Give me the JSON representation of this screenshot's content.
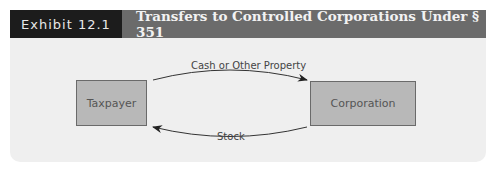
{
  "header": {
    "label": "Exhibit 12.1",
    "title": "Transfers to Controlled Corporations Under § 351"
  },
  "diagram": {
    "nodes": [
      {
        "id": "taxpayer",
        "label": "Taxpayer"
      },
      {
        "id": "corporation",
        "label": "Corporation"
      }
    ],
    "edges": [
      {
        "from": "taxpayer",
        "to": "corporation",
        "label": "Cash or Other Property"
      },
      {
        "from": "corporation",
        "to": "taxpayer",
        "label": "Stock"
      }
    ]
  },
  "colors": {
    "label_bg": "#1c1c1c",
    "title_bg": "#6b6b6b",
    "panel_bg": "#efefef",
    "box_fill": "#b8b8b8"
  }
}
